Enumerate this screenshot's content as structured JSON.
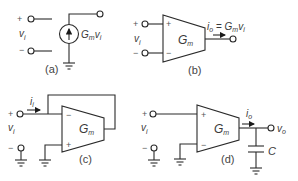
{
  "diagram": {
    "panels": [
      {
        "id": "a",
        "caption": "(a)",
        "input_plus": "+",
        "input_minus": "−",
        "input_voltage": {
          "main": "v",
          "sub": "i"
        },
        "source_label": {
          "g": "G",
          "gsub": "m",
          "v": "v",
          "vsub": "i"
        },
        "element": "voltage-controlled current source"
      },
      {
        "id": "b",
        "caption": "(b)",
        "input_plus": "+",
        "input_minus": "−",
        "input_voltage": {
          "main": "v",
          "sub": "i"
        },
        "amp_label": {
          "main": "G",
          "sub": "m"
        },
        "amp_plus": "+",
        "amp_minus": "−",
        "output_eq": {
          "i": "i",
          "isub": "o",
          "eq": " = ",
          "g": "G",
          "gsub": "m",
          "v": "v",
          "vsub": "i"
        },
        "element": "OTA symbol"
      },
      {
        "id": "c",
        "caption": "(c)",
        "input_plus": "+",
        "input_minus": "−",
        "input_voltage": {
          "main": "v",
          "sub": "i"
        },
        "input_current": {
          "main": "i",
          "sub": "i"
        },
        "amp_label": {
          "main": "G",
          "sub": "m"
        },
        "amp_plus": "+",
        "amp_minus": "−",
        "element": "OTA with unity feedback (simulated resistor)"
      },
      {
        "id": "d",
        "caption": "(d)",
        "input_plus": "+",
        "input_minus": "−",
        "input_voltage": {
          "main": "v",
          "sub": "i"
        },
        "output_current": {
          "main": "i",
          "sub": "o"
        },
        "output_voltage": {
          "main": "v",
          "sub": "o"
        },
        "capacitor": "C",
        "amp_label": {
          "main": "G",
          "sub": "m"
        },
        "amp_plus": "+",
        "amp_minus": "−",
        "element": "OTA driving capacitor (integrator)"
      }
    ]
  }
}
